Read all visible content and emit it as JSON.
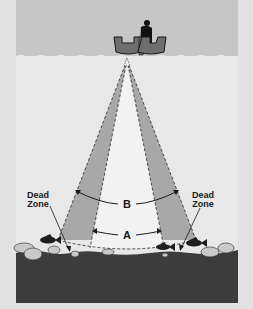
{
  "labels": {
    "dead_zone_left_line1": "Dead",
    "dead_zone_left_line2": "Zone",
    "dead_zone_right_line1": "Dead",
    "dead_zone_right_line2": "Zone",
    "cone_b": "B",
    "cone_a": "A"
  },
  "icons": {
    "boat": "boat-with-angler-icon",
    "fish": "fish-icon",
    "rocks": "rock-icon"
  },
  "colors": {
    "background": "#e2e2e2",
    "sky": "#c6c6c6",
    "water": "#e8e8e8",
    "outer_cone": "#a8a8a8",
    "inner_cone": "#f2f2f2",
    "bottom": "#3c3c3c",
    "rocks": "#c9c9c9",
    "boat": "#6e6e6e",
    "text": "#1a1a1a"
  }
}
